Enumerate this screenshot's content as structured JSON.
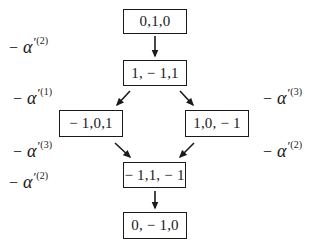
{
  "diagram": {
    "type": "weight-diagram",
    "nodes": [
      {
        "id": "n1",
        "label": "0,1,0"
      },
      {
        "id": "n2",
        "label": "1, − 1,1"
      },
      {
        "id": "n3",
        "label": "− 1,0,1"
      },
      {
        "id": "n4",
        "label": "1,0, − 1"
      },
      {
        "id": "n5",
        "label": "− 1,1, − 1"
      },
      {
        "id": "n6",
        "label": "0, − 1,0"
      }
    ],
    "edges": [
      {
        "from": "n1",
        "to": "n2",
        "label_index": 0
      },
      {
        "from": "n2",
        "to": "n3",
        "label_index": 1
      },
      {
        "from": "n2",
        "to": "n4",
        "label_index": 2
      },
      {
        "from": "n3",
        "to": "n5",
        "label_index": 3
      },
      {
        "from": "n4",
        "to": "n5",
        "label_index": 4
      },
      {
        "from": "n5",
        "to": "n6",
        "label_index": 5
      }
    ],
    "edge_labels": [
      {
        "minus": "−",
        "symbol": "α",
        "prime": "′",
        "sup": "(2)"
      },
      {
        "minus": "−",
        "symbol": "α",
        "prime": "′",
        "sup": "(1)"
      },
      {
        "minus": "−",
        "symbol": "α",
        "prime": "′",
        "sup": "(3)"
      },
      {
        "minus": "−",
        "symbol": "α",
        "prime": "′",
        "sup": "(3)"
      },
      {
        "minus": "−",
        "symbol": "α",
        "prime": "′",
        "sup": "(2)"
      },
      {
        "minus": "−",
        "symbol": "α",
        "prime": "′",
        "sup": "(2)"
      }
    ],
    "colors": {
      "stroke": "#1a1a1a",
      "background": "#ffffff"
    }
  }
}
